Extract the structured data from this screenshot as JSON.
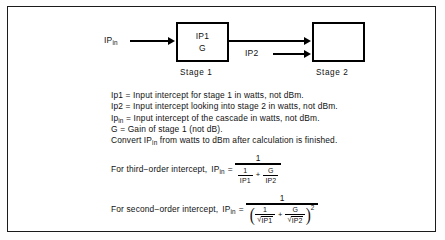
{
  "diagram": {
    "input_label": {
      "base": "IP",
      "sub": "in"
    },
    "mid_label": "IP2",
    "stage1": {
      "caption": "Stage 1",
      "lines": [
        "IP1",
        "G"
      ]
    },
    "stage2": {
      "caption": "Stage 2",
      "lines": []
    }
  },
  "definitions": [
    "Ip1 = Input intercept for stage 1 in watts, not dBm.",
    "Ip2 = Input intercept looking into stage 2 in watts, not dBm."
  ],
  "definitions_rich": {
    "line3_pre": "Ip",
    "line3_sub": "in",
    "line3_post": " = Input intercept of the cascade in watts, not dBm.",
    "line4": "G = Gain of stage 1 (not dB).",
    "line5_pre": "Convert IP",
    "line5_sub": "in",
    "line5_post": " from watts to dBm after calculation is finished."
  },
  "formulas": {
    "third_order": {
      "lead": "For third−order intercept,",
      "lhs_base": "IP",
      "lhs_sub": "in",
      "equals": "=",
      "numerator": "1",
      "den_term1_num": "1",
      "den_term1_den": "IP1",
      "den_operator": "+",
      "den_term2_num": "G",
      "den_term2_den": "IP2"
    },
    "second_order": {
      "lead": "For second−order intercept,",
      "lhs_base": "IP",
      "lhs_sub": "in",
      "equals": "=",
      "numerator": "1",
      "paren_open": "(",
      "paren_close": ")",
      "exponent": "2",
      "radical_sign": "√",
      "den_term1_num": "1",
      "den_term1_den": "IP1",
      "den_operator": "+",
      "den_term2_num": "G",
      "den_term2_den": "IP2"
    }
  },
  "colors": {
    "ink": "#111111",
    "frame": "#1a1a1a",
    "background": "#ffffff"
  }
}
